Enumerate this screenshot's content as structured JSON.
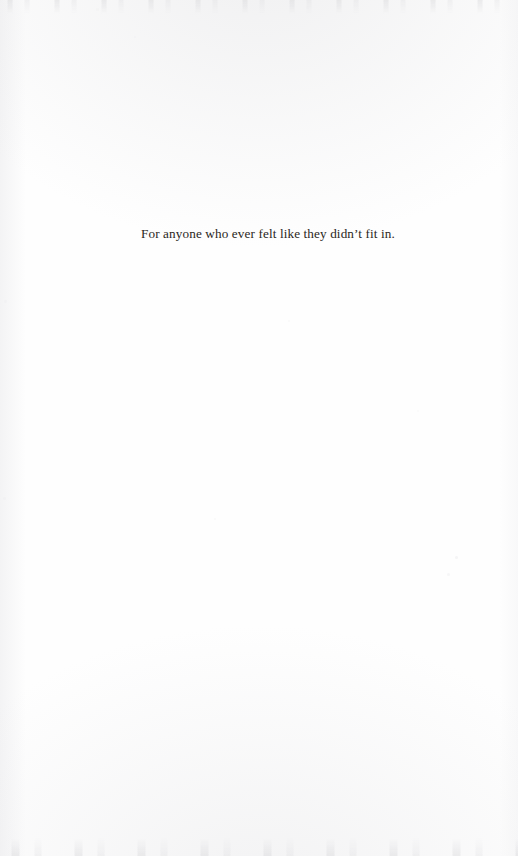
{
  "page": {
    "kind": "book-dedication-page",
    "background_color": "#fefefe",
    "ink_color": "#2a2622",
    "width": 518,
    "height": 856
  },
  "dedication": {
    "text": "For anyone who ever felt like they didn’t fit in."
  },
  "artifacts": {
    "specks": [
      {
        "x": 455,
        "y": 556,
        "size": 3.0,
        "opacity": 0.55
      },
      {
        "x": 447,
        "y": 573,
        "size": 3.4,
        "opacity": 0.45
      },
      {
        "x": 134,
        "y": 36,
        "size": 2.4,
        "opacity": 0.4
      },
      {
        "x": 288,
        "y": 320,
        "size": 2.0,
        "opacity": 0.35
      },
      {
        "x": 4,
        "y": 300,
        "size": 3.2,
        "opacity": 0.4
      },
      {
        "x": 3,
        "y": 497,
        "size": 3.0,
        "opacity": 0.38
      },
      {
        "x": 214,
        "y": 518,
        "size": 2.2,
        "opacity": 0.32
      },
      {
        "x": 417,
        "y": 410,
        "size": 2.0,
        "opacity": 0.3
      },
      {
        "x": 96,
        "y": 8,
        "size": 2.6,
        "opacity": 0.35
      },
      {
        "x": 306,
        "y": 6,
        "size": 3.0,
        "opacity": 0.4
      }
    ]
  }
}
